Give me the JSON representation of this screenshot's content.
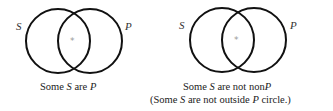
{
  "diagrams": [
    {
      "id": "left",
      "circles": [
        {
          "name": "S",
          "cx": 58,
          "cy": 41,
          "r": 32
        },
        {
          "name": "P",
          "cx": 90,
          "cy": 41,
          "r": 32
        }
      ],
      "labels": {
        "s": "S",
        "p": "P"
      },
      "mark": "*",
      "caption": {
        "line1": {
          "pre": "Some ",
          "var1": "S",
          "mid": " are ",
          "var2": "P",
          "post": ""
        }
      }
    },
    {
      "id": "right",
      "circles": [
        {
          "name": "S",
          "cx": 222,
          "cy": 40,
          "r": 32
        },
        {
          "name": "P",
          "cx": 254,
          "cy": 40,
          "r": 32
        }
      ],
      "labels": {
        "s": "S",
        "p": "P"
      },
      "mark": "*",
      "caption": {
        "line1": {
          "pre": "Some ",
          "var1": "S",
          "mid": " are not non",
          "var2": "P",
          "post": ""
        },
        "line2": {
          "pre": "(Some ",
          "var1": "S",
          "mid": " are not outside ",
          "var2": "P",
          "post": " circle.)"
        }
      }
    }
  ],
  "colors": {
    "stroke": "#111111",
    "mark": "#999999",
    "text": "#222222"
  }
}
